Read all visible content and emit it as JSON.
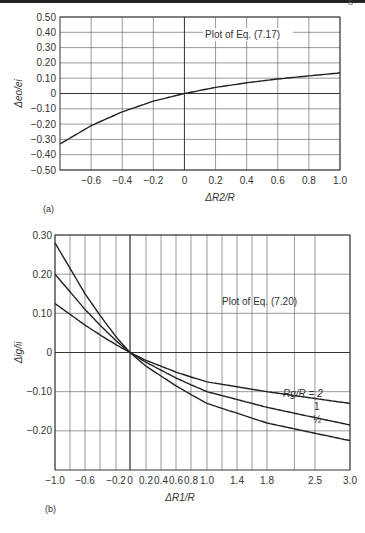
{
  "page": {
    "header_fragment": "g  ...",
    "rule_color": "#222222"
  },
  "chart_data": [
    {
      "panel": "(a)",
      "type": "line",
      "title": "",
      "annotation": "Plot of Eq. (7.17)",
      "xlabel": "ΔR2/R",
      "ylabel": "Δeo/ei",
      "xlim": [
        -0.8,
        1.0
      ],
      "ylim": [
        -0.5,
        0.5
      ],
      "xticks": [
        -0.6,
        -0.4,
        -0.2,
        0,
        0.2,
        0.4,
        0.6,
        0.8,
        1.0
      ],
      "xtick_labels": [
        "−0.6",
        "−0.4",
        "−0.2",
        "0",
        "0.2",
        "0.4",
        "0.6",
        "0.8",
        "1.0"
      ],
      "yticks": [
        0.5,
        0.4,
        0.3,
        0.2,
        0.1,
        0,
        -0.1,
        -0.2,
        -0.3,
        -0.4,
        -0.5
      ],
      "ytick_labels": [
        "0.50",
        "0.40",
        "0.30",
        "0.20",
        "0.10",
        "0",
        "−0.10",
        "−0.20",
        "−0.30",
        "−0.40",
        "−0.50"
      ],
      "grid": true,
      "series": [
        {
          "name": "Eq. (7.17)",
          "x": [
            -0.8,
            -0.6,
            -0.4,
            -0.2,
            0,
            0.2,
            0.4,
            0.6,
            0.8,
            1.0
          ],
          "y": [
            -0.33,
            -0.21,
            -0.12,
            -0.05,
            0.0,
            0.04,
            0.07,
            0.095,
            0.115,
            0.135
          ]
        }
      ]
    },
    {
      "panel": "(b)",
      "type": "line",
      "title": "",
      "annotation": "Plot of Eq. (7.20)",
      "xlabel": "ΔR1/R",
      "ylabel": "Δig/ii",
      "xlim": [
        -1.0,
        3.0
      ],
      "ylim": [
        -0.3,
        0.3
      ],
      "x_scale": "nonlinear (compressed at high values)",
      "xticks": [
        -1.0,
        -0.6,
        -0.2,
        0,
        0.2,
        0.4,
        0.6,
        0.8,
        1.0,
        1.4,
        1.8,
        2.5,
        3.0
      ],
      "xtick_labels": [
        "−1.0",
        "−0.6",
        "−0.2",
        "0",
        "0.2",
        "0.4",
        "0.6",
        "0.8",
        "1.0",
        "1.4",
        "1.8",
        "2.5",
        "3.0"
      ],
      "yticks": [
        0.3,
        0.2,
        0.1,
        0,
        -0.1,
        -0.2
      ],
      "ytick_labels": [
        "0.30",
        "0.20",
        "0.10",
        "0",
        "−0.10",
        "−0.20"
      ],
      "grid": true,
      "series": [
        {
          "name": "Rg/R = 2",
          "label": "Rg/R = 2",
          "x": [
            -1.0,
            -0.6,
            -0.2,
            0,
            0.2,
            0.6,
            1.0,
            1.8,
            3.0
          ],
          "y": [
            0.125,
            0.07,
            0.02,
            0.0,
            -0.02,
            -0.05,
            -0.075,
            -0.1,
            -0.13
          ]
        },
        {
          "name": "Rg/R = 1",
          "label": "1",
          "x": [
            -1.0,
            -0.6,
            -0.2,
            0,
            0.2,
            0.6,
            1.0,
            1.8,
            3.0
          ],
          "y": [
            0.2,
            0.11,
            0.03,
            0.0,
            -0.025,
            -0.065,
            -0.1,
            -0.14,
            -0.185
          ]
        },
        {
          "name": "Rg/R = 1/2",
          "label": "½",
          "x": [
            -1.0,
            -0.6,
            -0.2,
            0,
            0.2,
            0.6,
            1.0,
            1.8,
            3.0
          ],
          "y": [
            0.28,
            0.15,
            0.04,
            0.0,
            -0.035,
            -0.085,
            -0.13,
            -0.18,
            -0.225
          ]
        }
      ]
    }
  ]
}
